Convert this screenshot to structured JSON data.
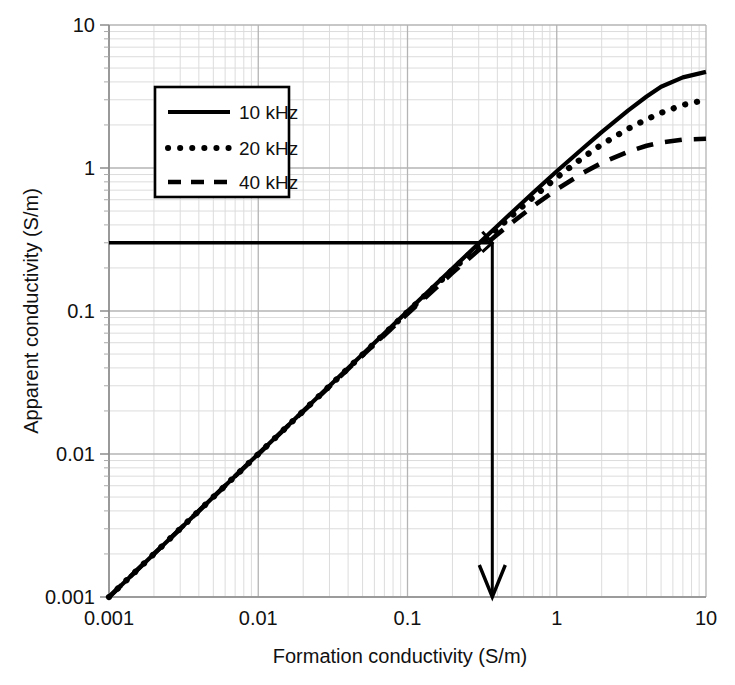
{
  "chart_data": {
    "type": "line",
    "title": "",
    "xlabel": "Formation conductivity (S/m)",
    "ylabel": "Apparent conductivity (S/m)",
    "xscale": "log",
    "yscale": "log",
    "xlim": [
      0.001,
      10
    ],
    "ylim": [
      0.001,
      10
    ],
    "grid": true,
    "grid_minor": true,
    "legend_position": "upper-left-inside",
    "x_tick_labels": [
      "0.001",
      "0.01",
      "0.1",
      "1",
      "10"
    ],
    "y_tick_labels": [
      "0.001",
      "0.01",
      "0.1",
      "1",
      "10"
    ],
    "x_ticks": [
      0.001,
      0.01,
      0.1,
      1,
      10
    ],
    "y_ticks": [
      0.001,
      0.01,
      0.1,
      1,
      10
    ],
    "series": [
      {
        "name": "10 kHz",
        "style": "solid",
        "x": [
          0.001,
          0.002,
          0.005,
          0.01,
          0.02,
          0.05,
          0.1,
          0.2,
          0.3,
          0.4,
          0.5,
          0.7,
          1.0,
          1.5,
          2.0,
          3.0,
          4.0,
          5.0,
          7.0,
          10.0
        ],
        "y": [
          0.001,
          0.002,
          0.005,
          0.00999,
          0.01997,
          0.0499,
          0.0996,
          0.1984,
          0.2962,
          0.3929,
          0.4885,
          0.676,
          0.948,
          1.375,
          1.78,
          2.52,
          3.16,
          3.7,
          4.3,
          4.7
        ]
      },
      {
        "name": "20 kHz",
        "style": "dotted",
        "x": [
          0.001,
          0.002,
          0.005,
          0.01,
          0.02,
          0.05,
          0.1,
          0.2,
          0.3,
          0.4,
          0.5,
          0.7,
          1.0,
          1.5,
          2.0,
          3.0,
          4.0,
          5.0,
          7.0,
          10.0
        ],
        "y": [
          0.001,
          0.002,
          0.005,
          0.00998,
          0.01993,
          0.0496,
          0.0985,
          0.1942,
          0.2872,
          0.3772,
          0.4645,
          0.629,
          0.858,
          1.185,
          1.46,
          1.88,
          2.19,
          2.43,
          2.76,
          3.0
        ]
      },
      {
        "name": "40 kHz",
        "style": "dashed",
        "x": [
          0.001,
          0.002,
          0.005,
          0.01,
          0.02,
          0.05,
          0.1,
          0.2,
          0.3,
          0.4,
          0.5,
          0.7,
          1.0,
          1.5,
          2.0,
          3.0,
          4.0,
          5.0,
          7.0,
          10.0
        ],
        "y": [
          0.001,
          0.002,
          0.005,
          0.00996,
          0.01984,
          0.0489,
          0.0957,
          0.1847,
          0.2671,
          0.3434,
          0.4145,
          0.543,
          0.709,
          0.925,
          1.085,
          1.3,
          1.43,
          1.51,
          1.58,
          1.6
        ]
      }
    ],
    "annotations": [
      {
        "kind": "crosshair",
        "label": "",
        "x": 0.37,
        "y": 0.3,
        "horizontal_line_from_x": 0.001,
        "vertical_line_to_y": 0.001,
        "arrow": "down"
      }
    ],
    "colors": {
      "series": "#000000",
      "grid_major": "#b4b4b4",
      "grid_minor": "#dcdcdc",
      "axis": "#808080",
      "annotation": "#000000",
      "background": "#ffffff"
    }
  },
  "legend": {
    "entries": [
      {
        "label": "10 kHz",
        "style": "solid"
      },
      {
        "label": "20 kHz",
        "style": "dotted"
      },
      {
        "label": "40 kHz",
        "style": "dashed"
      }
    ]
  },
  "axes": {
    "x_title": "Formation conductivity (S/m)",
    "y_title": "Apparent conductivity (S/m)"
  }
}
